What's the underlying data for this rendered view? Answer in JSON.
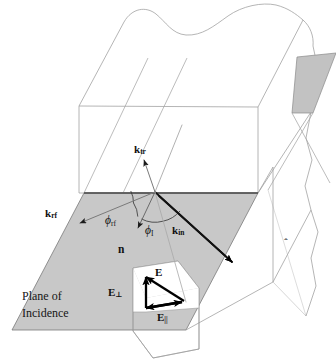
{
  "figure": {
    "title": "Plane of Incidence",
    "colors": {
      "plane_fill": "#c8c8c8",
      "plane_stroke": "#6e6e6e",
      "block_stroke": "#9a9a9a",
      "interface_line": "#555555",
      "ray_stroke": "#1a1a1a",
      "thin_ray_stroke": "#6a6a6a",
      "vector_stroke": "#000000",
      "background": "#ffffff",
      "label_color": "#101010"
    }
  },
  "labels": {
    "k_transmitted": "k",
    "k_transmitted_sub": "tr",
    "k_reflected": "k",
    "k_reflected_sub": "rf",
    "k_incident": "k",
    "k_incident_sub": "in",
    "phi_reflected": "ϕ",
    "phi_reflected_sub": "rf",
    "phi_incident": "ϕ",
    "phi_incident_sub": "I",
    "normal": "n",
    "normal_hat": "ˆ",
    "e_total": "E",
    "e_perp": "E",
    "e_perp_sub": "⊥",
    "e_parallel": "E",
    "e_parallel_sub": "||",
    "plane_line1": "Plane of",
    "plane_line2": "Incidence"
  },
  "geometry": {
    "origin": {
      "x": 155,
      "y": 192
    },
    "rays": [
      {
        "name": "k_in",
        "from": {
          "x": 232,
          "y": 262
        },
        "to": {
          "x": 155,
          "y": 192
        },
        "arrow_at": "from",
        "weight": "heavy"
      },
      {
        "name": "k_rf",
        "from": {
          "x": 155,
          "y": 192
        },
        "to": {
          "x": 77,
          "y": 224
        },
        "arrow_at": "to",
        "weight": "light"
      },
      {
        "name": "k_tr",
        "from": {
          "x": 155,
          "y": 192
        },
        "to": {
          "x": 143,
          "y": 157
        },
        "arrow_at": "to",
        "weight": "light"
      },
      {
        "name": "normal_n",
        "from": {
          "x": 155,
          "y": 192
        },
        "to": {
          "x": 137,
          "y": 230
        },
        "arrow_at": "to",
        "weight": "light"
      },
      {
        "name": "continuation",
        "from": {
          "x": 155,
          "y": 192
        },
        "to": {
          "x": 180,
          "y": 128
        },
        "arrow_at": "none",
        "weight": "light"
      }
    ],
    "angle_arcs": [
      {
        "name": "phi_rf_arc",
        "radius": 26
      },
      {
        "name": "phi_I_arc",
        "radius": 30
      }
    ],
    "field_vectors": [
      {
        "name": "E_total",
        "from": {
          "x": 184,
          "y": 300
        },
        "to": {
          "x": 143,
          "y": 274
        }
      },
      {
        "name": "E_perp",
        "from": {
          "x": 145,
          "y": 307
        },
        "to": {
          "x": 145,
          "y": 274
        }
      },
      {
        "name": "E_parallel",
        "from": {
          "x": 145,
          "y": 307
        },
        "to": {
          "x": 184,
          "y": 300
        }
      }
    ]
  }
}
